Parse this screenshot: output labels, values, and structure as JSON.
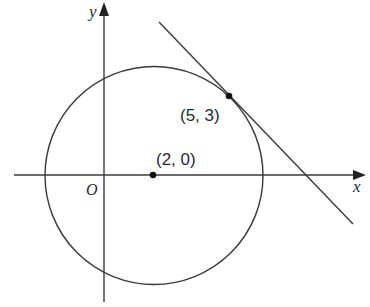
{
  "diagram": {
    "type": "coordinate-geometry",
    "axes": {
      "x_label": "x",
      "y_label": "y",
      "origin_label": "O"
    },
    "circle": {
      "center": [
        2,
        0
      ],
      "center_label": "(2, 0)",
      "radius_squared": 18
    },
    "tangent_point": {
      "coords": [
        5,
        3
      ],
      "label": "(5, 3)"
    },
    "tangent_line": {
      "passes_through": [
        5,
        3
      ],
      "slope": -1
    },
    "colors": {
      "stroke": "#3a3a3a",
      "background": "#ffffff"
    }
  }
}
